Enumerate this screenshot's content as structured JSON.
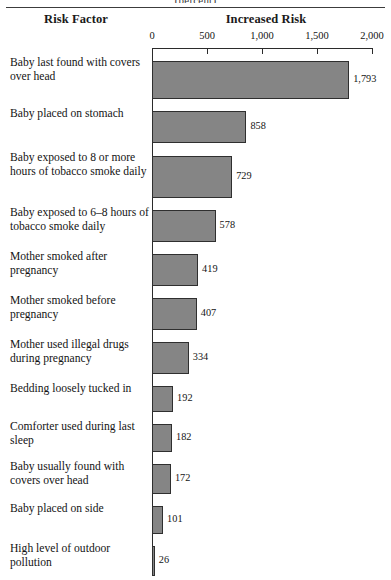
{
  "figure": {
    "unit_caption": "(percent)",
    "header_risk_factor": "Risk Factor",
    "header_increased_risk": "Increased Risk"
  },
  "chart_data": {
    "type": "bar",
    "orientation": "horizontal",
    "title": "Increased Risk",
    "subtitle": "(percent)",
    "xlabel": "Increased Risk",
    "ylabel": "Risk Factor",
    "xlim": [
      0,
      2000
    ],
    "grid": false,
    "legend": "none",
    "bar_color": "#858585",
    "bar_border_color": "#2f2f2f",
    "tick_labels": [
      "0",
      "500",
      "1,000",
      "1,500",
      "2,000"
    ],
    "ticks": [
      0,
      500,
      1000,
      1500,
      2000
    ],
    "categories": [
      "Baby last found with covers over head",
      "Baby placed on stomach",
      "Baby exposed to 8 or more hours of tobacco smoke daily",
      "Baby exposed to 6–8 hours of tobacco smoke daily",
      "Mother smoked after pregnancy",
      "Mother smoked before pregnancy",
      "Mother used illegal drugs during pregnancy",
      "Bedding loosely tucked in",
      "Comforter used during last sleep",
      "Baby usually found with covers over head",
      "Baby placed on side",
      "High level of outdoor pollution"
    ],
    "values": [
      1793,
      858,
      729,
      578,
      419,
      407,
      334,
      192,
      182,
      172,
      101,
      26
    ],
    "value_labels": [
      "1,793",
      "858",
      "729",
      "578",
      "419",
      "407",
      "334",
      "192",
      "182",
      "172",
      "101",
      "26"
    ]
  },
  "rows": [
    {
      "label": "Baby last found with covers over head",
      "value": 1793,
      "value_label": "1,793"
    },
    {
      "label": "Baby placed on stomach",
      "value": 858,
      "value_label": "858"
    },
    {
      "label": "Baby exposed to 8 or more hours of tobacco smoke daily",
      "value": 729,
      "value_label": "729"
    },
    {
      "label": "Baby exposed to 6–8 hours of tobacco smoke daily",
      "value": 578,
      "value_label": "578"
    },
    {
      "label": "Mother smoked after pregnancy",
      "value": 419,
      "value_label": "419"
    },
    {
      "label": "Mother smoked before pregnancy",
      "value": 407,
      "value_label": "407"
    },
    {
      "label": "Mother used illegal drugs during pregnancy",
      "value": 334,
      "value_label": "334"
    },
    {
      "label": "Bedding loosely tucked in",
      "value": 192,
      "value_label": "192"
    },
    {
      "label": "Comforter used during last sleep",
      "value": 182,
      "value_label": "182"
    },
    {
      "label": "Baby usually found with covers over head",
      "value": 172,
      "value_label": "172"
    },
    {
      "label": "Baby placed on side",
      "value": 101,
      "value_label": "101"
    },
    {
      "label": "High level of outdoor pollution",
      "value": 26,
      "value_label": "26"
    }
  ],
  "axis": {
    "ticks": [
      {
        "label": "0",
        "value": 0
      },
      {
        "label": "500",
        "value": 500
      },
      {
        "label": "1,000",
        "value": 1000
      },
      {
        "label": "1,500",
        "value": 1500
      },
      {
        "label": "2,000",
        "value": 2000
      }
    ]
  }
}
